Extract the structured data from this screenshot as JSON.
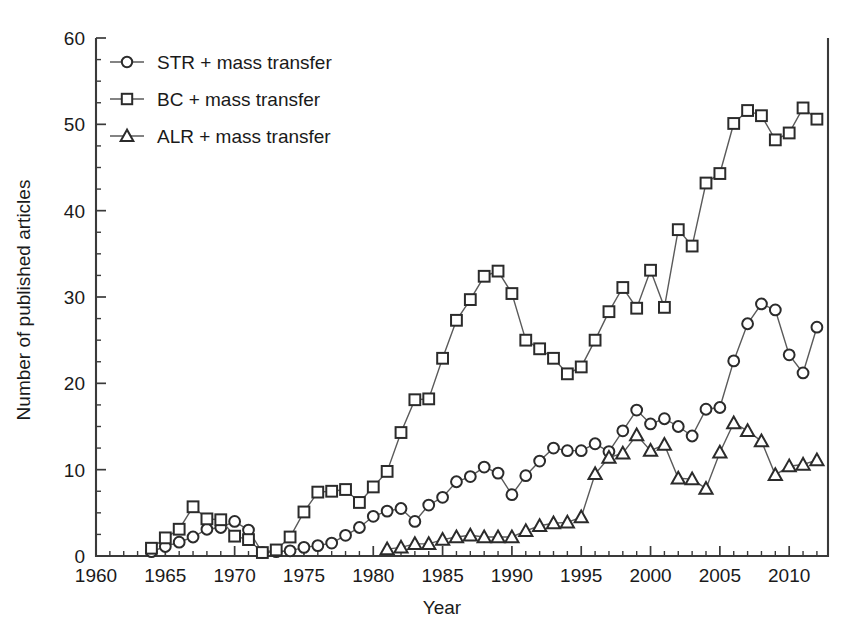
{
  "chart_data": {
    "type": "line",
    "title": "",
    "xlabel": "Year",
    "ylabel": "Number of published articles",
    "xlim": [
      1960,
      2012.8
    ],
    "ylim": [
      0,
      60
    ],
    "x_major_ticks": [
      1960,
      1965,
      1970,
      1975,
      1980,
      1985,
      1990,
      1995,
      2000,
      2005,
      2010
    ],
    "x_tick_labels": [
      "1960",
      "1965",
      "1970",
      "1975",
      "1980",
      "1985",
      "1990",
      "1995",
      "2000",
      "2005",
      "2010"
    ],
    "x_minor_step": 1,
    "y_major_ticks": [
      0,
      10,
      20,
      30,
      40,
      50,
      60
    ],
    "y_tick_labels": [
      "0",
      "10",
      "20",
      "30",
      "40",
      "50",
      "60"
    ],
    "y_minor_step": 2.5,
    "grid": false,
    "legend_position": "top-left",
    "series": [
      {
        "name": "STR + mass transfer",
        "marker": "circle",
        "x": [
          1964,
          1965,
          1966,
          1967,
          1968,
          1969,
          1970,
          1971,
          1972,
          1973,
          1974,
          1975,
          1976,
          1977,
          1978,
          1979,
          1980,
          1981,
          1982,
          1983,
          1984,
          1985,
          1986,
          1987,
          1988,
          1989,
          1990,
          1991,
          1992,
          1993,
          1994,
          1995,
          1996,
          1997,
          1998,
          1999,
          2000,
          2001,
          2002,
          2003,
          2004,
          2005,
          2006,
          2007,
          2008,
          2009,
          2010,
          2011,
          2012
        ],
        "y": [
          0.5,
          1.1,
          1.6,
          2.2,
          3.1,
          3.3,
          4.0,
          3.0,
          0.4,
          0.5,
          0.6,
          1.0,
          1.2,
          1.5,
          2.4,
          3.3,
          4.6,
          5.2,
          5.5,
          4.0,
          5.9,
          6.8,
          8.6,
          9.2,
          10.3,
          9.6,
          7.1,
          9.3,
          11.0,
          12.5,
          12.2,
          12.2,
          13.0,
          12.1,
          14.5,
          16.9,
          15.3,
          15.9,
          15.0,
          13.9,
          17.0,
          17.2,
          22.6,
          26.9,
          29.2,
          28.5,
          23.3,
          21.2,
          26.5
        ]
      },
      {
        "name": "BC + mass transfer",
        "marker": "square",
        "x": [
          1964,
          1965,
          1966,
          1967,
          1968,
          1969,
          1970,
          1971,
          1972,
          1973,
          1974,
          1975,
          1976,
          1977,
          1978,
          1979,
          1980,
          1981,
          1982,
          1983,
          1984,
          1985,
          1986,
          1987,
          1988,
          1989,
          1990,
          1991,
          1992,
          1993,
          1994,
          1995,
          1996,
          1997,
          1998,
          1999,
          2000,
          2001,
          2002,
          2003,
          2004,
          2005,
          2006,
          2007,
          2008,
          2009,
          2010,
          2011,
          2012
        ],
        "y": [
          0.9,
          2.1,
          3.1,
          5.7,
          4.3,
          4.2,
          2.3,
          1.9,
          0.4,
          0.7,
          2.2,
          5.1,
          7.4,
          7.5,
          7.7,
          6.2,
          8.0,
          9.8,
          14.3,
          18.1,
          18.2,
          22.9,
          27.3,
          29.7,
          32.4,
          33.0,
          30.4,
          25.0,
          24.0,
          22.9,
          21.1,
          21.9,
          25.0,
          28.3,
          31.1,
          28.7,
          33.1,
          28.8,
          37.8,
          35.9,
          43.2,
          44.3,
          50.1,
          51.6,
          51.0,
          48.2,
          49.0,
          51.9,
          50.6
        ]
      },
      {
        "name": "ALR + mass transfer",
        "marker": "triangle",
        "x": [
          1981,
          1982,
          1983,
          1984,
          1985,
          1986,
          1987,
          1988,
          1989,
          1990,
          1991,
          1992,
          1993,
          1994,
          1995,
          1996,
          1997,
          1998,
          1999,
          2000,
          2001,
          2002,
          2003,
          2004,
          2005,
          2006,
          2007,
          2008,
          2009,
          2010,
          2011,
          2012
        ],
        "y": [
          0.8,
          1.0,
          1.4,
          1.4,
          1.9,
          2.2,
          2.4,
          2.2,
          2.2,
          2.2,
          2.9,
          3.5,
          3.8,
          3.9,
          4.5,
          9.5,
          11.4,
          11.9,
          14.0,
          12.2,
          12.9,
          9.0,
          8.9,
          7.8,
          12.0,
          15.4,
          14.5,
          13.3,
          9.4,
          10.4,
          10.6,
          11.1
        ]
      }
    ]
  },
  "legend": {
    "entries": [
      {
        "label": "STR + mass transfer",
        "marker": "circle"
      },
      {
        "label": "BC + mass transfer",
        "marker": "square"
      },
      {
        "label": "ALR + mass transfer",
        "marker": "triangle"
      }
    ]
  },
  "colors": {
    "axis": "#3a3a3a",
    "line": "#5a5a5a",
    "marker_stroke": "#2b2b2b",
    "marker_fill": "#ffffff",
    "background": "#ffffff",
    "text": "#1a1a1a"
  }
}
